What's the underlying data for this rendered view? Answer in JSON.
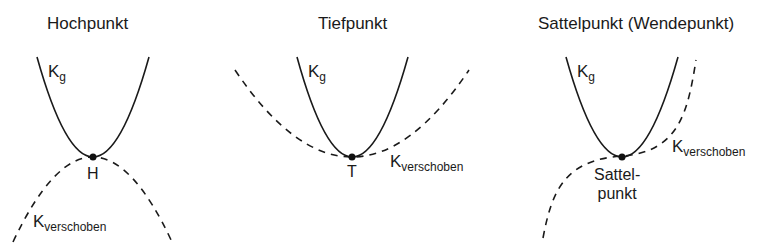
{
  "panels": [
    {
      "title": "Hochpunkt",
      "curve_label_main": "K",
      "curve_label_main_sub": "g",
      "curve_label_shifted": "K",
      "curve_label_shifted_sub": "verschoben",
      "point_label": "H"
    },
    {
      "title": "Tiefpunkt",
      "curve_label_main": "K",
      "curve_label_main_sub": "g",
      "curve_label_shifted": "K",
      "curve_label_shifted_sub": "verschoben",
      "point_label": "T"
    },
    {
      "title": "Sattelpunkt (Wendepunkt)",
      "curve_label_main": "K",
      "curve_label_main_sub": "g",
      "curve_label_shifted": "K",
      "curve_label_shifted_sub": "verschoben",
      "point_label_line1": "Sattel-",
      "point_label_line2": "punkt"
    }
  ],
  "colors": {
    "line": "#1a1a1a",
    "background": "#ffffff"
  }
}
